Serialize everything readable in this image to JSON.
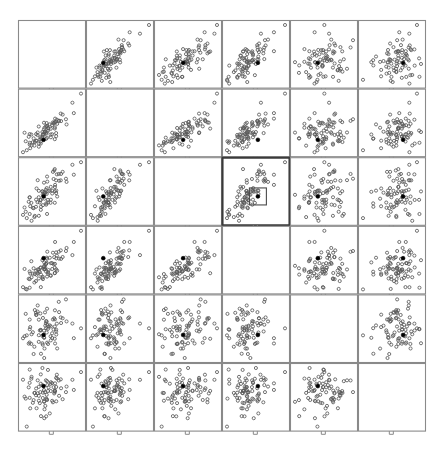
{
  "figure": {
    "type": "scatterplot-matrix",
    "title": "",
    "variables": [
      "LUNG",
      "HEART",
      "LIVER",
      "SPLEEN",
      "KIDNEY",
      "TESTES"
    ],
    "n_variables": 6,
    "n_points": 80,
    "marker": "open-circle",
    "highlight_marker": "filled-dot",
    "selected_cell": {
      "row": 2,
      "col": 3
    },
    "brush_box_label": "brush-selection-box",
    "colors": {
      "background": "#ffffff",
      "frame": "#8a8a8a",
      "frame_selected": "#3a3a3a",
      "point": "#5a5a5a",
      "point_highlight": "#000000",
      "text": "#111111"
    }
  },
  "chart_data": {
    "type": "scatter",
    "title": "",
    "xlabel": "",
    "ylabel": "",
    "grid": false,
    "legend": "none",
    "layout": "6x6 scatterplot matrix, diagonal shows variable name with axis limits",
    "variables": [
      {
        "name": "LUNG",
        "max": 0.218,
        "min": -0.493,
        "max_label": "0.218",
        "min_label": "-0.493"
      },
      {
        "name": "HEART",
        "max": 0.265,
        "min": -0.384,
        "max_label": "0.265",
        "min_label": "-0.384"
      },
      {
        "name": "LIVER",
        "max": 1.19,
        "min": 0.211,
        "max_label": "1.19",
        "min_label": "0.211"
      },
      {
        "name": "SPLEEN",
        "max": -0.525,
        "min": -1.53,
        "max_label": "-0.525",
        "min_label": "-1.53"
      },
      {
        "name": "KIDNEY",
        "max": 0.24,
        "min": -0.0862,
        "max_label": "0.24",
        "min_label": "-0.0862"
      },
      {
        "name": "TESTES",
        "max": 0.385,
        "min": -0.511,
        "max_label": "0.385",
        "min_label": "-0.511"
      }
    ],
    "correlation_matrix": [
      [
        1.0,
        0.86,
        0.8,
        0.74,
        0.26,
        0.1
      ],
      [
        0.86,
        1.0,
        0.83,
        0.76,
        0.3,
        0.12
      ],
      [
        0.8,
        0.83,
        1.0,
        0.81,
        0.28,
        0.14
      ],
      [
        0.74,
        0.76,
        0.81,
        1.0,
        0.33,
        0.16
      ],
      [
        0.26,
        0.3,
        0.28,
        0.33,
        1.0,
        0.22
      ],
      [
        0.1,
        0.12,
        0.14,
        0.16,
        0.22,
        1.0
      ]
    ],
    "highlighted_point_index": 37
  }
}
